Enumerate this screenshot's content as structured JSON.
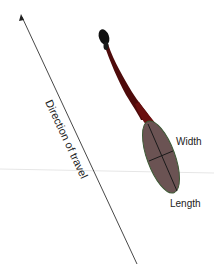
{
  "diagram": {
    "labels": {
      "direction": "Direction of travel",
      "width": "Width",
      "length": "Length"
    },
    "colors": {
      "background": "#ffffff",
      "arrow": "#333333",
      "head": "#111111",
      "tail": "#5a0d0d",
      "body_fill": "#6b5353",
      "body_stroke": "#4a6a40",
      "axes": "#1a1a1a",
      "horizon": "#e4e4e4"
    }
  }
}
